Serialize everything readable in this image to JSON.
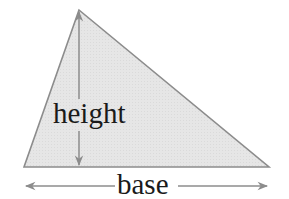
{
  "diagram": {
    "labels": {
      "height": "height",
      "base": "base"
    },
    "colors": {
      "fill": "#e4e4e4",
      "stroke": "#8c8c8c",
      "arrow": "#8c8c8c",
      "text": "#1a1a1a"
    },
    "shape": {
      "type": "triangle",
      "vertices": [
        [
          79,
          10
        ],
        [
          24,
          167
        ],
        [
          269,
          167
        ]
      ]
    }
  }
}
